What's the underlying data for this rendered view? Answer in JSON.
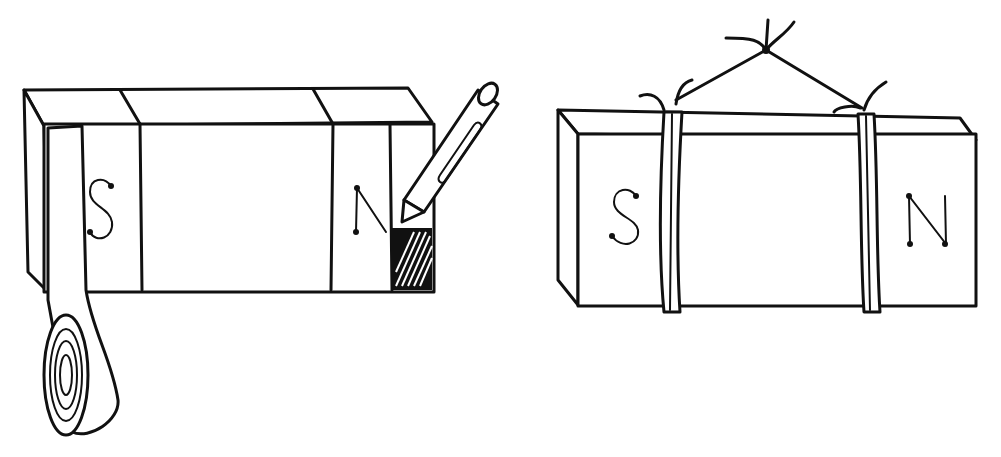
{
  "figure": {
    "left_panel": {
      "description": "Bar magnet with tape band being marked with crayon at N end",
      "labels": {
        "south": "S",
        "north": "N"
      },
      "objects": [
        "bar-magnet",
        "tape-roll",
        "crayon"
      ]
    },
    "right_panel": {
      "description": "Bar magnet suspended by string tied in two loops",
      "labels": {
        "south": "S",
        "north": "N"
      },
      "objects": [
        "bar-magnet",
        "string-harness"
      ]
    }
  }
}
